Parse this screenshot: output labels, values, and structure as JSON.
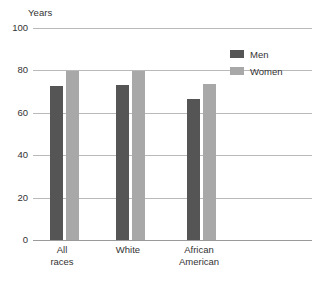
{
  "chart_data": {
    "type": "bar",
    "title": "",
    "subtitle": "",
    "xlabel": "",
    "ylabel": "Years",
    "ylim": [
      0,
      100
    ],
    "yticks": [
      "0",
      "20",
      "40",
      "60",
      "80",
      "100"
    ],
    "ytick_values": [
      0,
      20,
      40,
      60,
      80,
      100
    ],
    "grid": true,
    "legend_position": "top-right",
    "categories": [
      "All races",
      "White",
      "African American"
    ],
    "category_lines": [
      [
        "All",
        "races"
      ],
      [
        "White"
      ],
      [
        "African",
        "American"
      ]
    ],
    "series": [
      {
        "name": "Men",
        "color": "#555555",
        "values": [
          72.5,
          73.0,
          66.5
        ]
      },
      {
        "name": "Women",
        "color": "#a8a8a8",
        "values": [
          79.5,
          79.5,
          73.5
        ]
      }
    ]
  },
  "axis": {
    "unit_label": "Years"
  },
  "legend": {
    "items": [
      {
        "label": "Men",
        "swatch_color": "#555555"
      },
      {
        "label": "Women",
        "swatch_color": "#a8a8a8"
      }
    ]
  },
  "colors": {
    "men": "#555555",
    "women": "#a8a8a8",
    "gridline": "#b9b9b9",
    "baseline": "#9a9a9a",
    "text": "#333333",
    "background": "#ffffff"
  }
}
